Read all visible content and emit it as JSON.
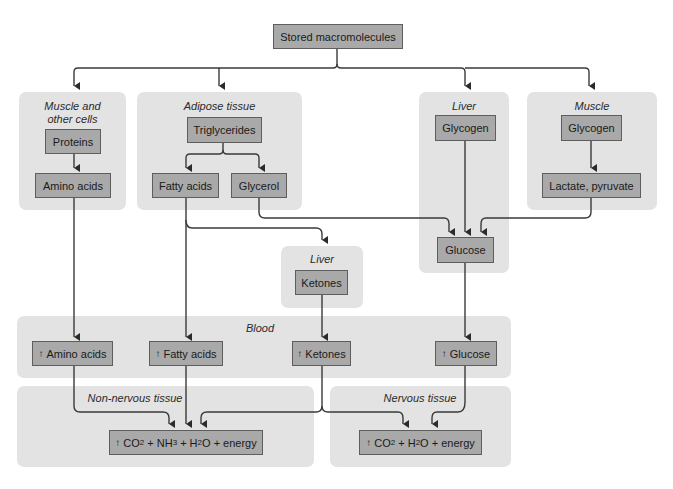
{
  "top": {
    "label": "Stored macromolecules"
  },
  "regions": {
    "muscle_other": {
      "label_line1": "Muscle and",
      "label_line2": "other cells"
    },
    "adipose": {
      "label": "Adipose tissue"
    },
    "liver_top": {
      "label": "Liver"
    },
    "muscle": {
      "label": "Muscle"
    },
    "liver_mid": {
      "label": "Liver"
    },
    "blood": {
      "label": "Blood"
    },
    "non_nervous": {
      "label": "Non-nervous tissue"
    },
    "nervous": {
      "label": "Nervous tissue"
    }
  },
  "nodes": {
    "proteins": "Proteins",
    "amino_acids": "Amino acids",
    "triglycerides": "Triglycerides",
    "fatty_acids": "Fatty acids",
    "glycerol": "Glycerol",
    "liver_glycogen": "Glycogen",
    "muscle_glycogen": "Glycogen",
    "lactate_pyruvate": "Lactate, pyruvate",
    "glucose": "Glucose",
    "ketones": "Ketones",
    "blood_amino_acids": "Amino acids",
    "blood_fatty_acids": "Fatty acids",
    "blood_ketones": "Ketones",
    "blood_glucose": "Glucose"
  },
  "increase_symbol": "↑",
  "outputs": {
    "non_nervous": {
      "co2": "CO",
      "co2_sub": "2",
      "nh3": " + NH",
      "nh3_sub": "3",
      "h2o": " + H",
      "h2o_sub": "2",
      "rest": "O + energy"
    },
    "nervous": {
      "co2": "CO",
      "co2_sub": "2",
      "h2o": " + H",
      "h2o_sub": "2",
      "rest": "O + energy"
    }
  }
}
